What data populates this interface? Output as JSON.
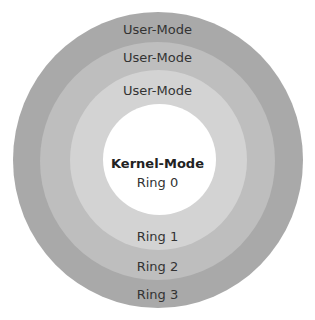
{
  "diagram": {
    "rings": [
      {
        "id": "ring3",
        "label": "Ring 3",
        "mode": "User-Mode",
        "color": "#a9a9a9"
      },
      {
        "id": "ring2",
        "label": "Ring 2",
        "mode": "User-Mode",
        "color": "#bebebe"
      },
      {
        "id": "ring1",
        "label": "Ring 1",
        "mode": "User-Mode",
        "color": "#d3d3d3"
      },
      {
        "id": "ring0",
        "label": "Ring 0",
        "mode": "Kernel-Mode",
        "color": "#ffffff"
      }
    ]
  }
}
